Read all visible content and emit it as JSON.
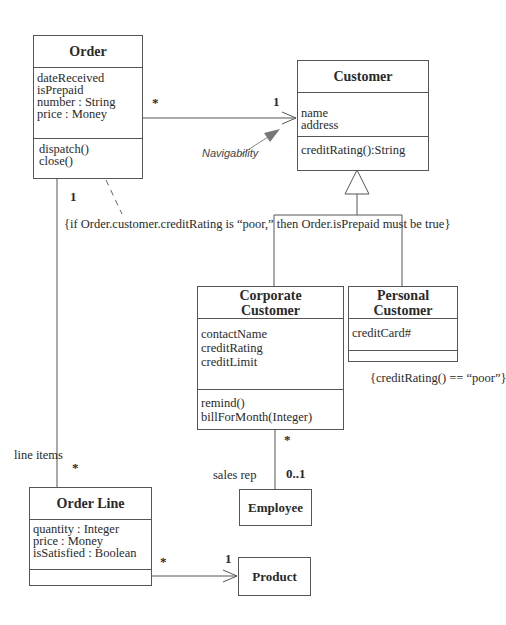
{
  "classes": {
    "order": {
      "name": "Order",
      "attributes": [
        "dateReceived",
        "isPrepaid",
        "number : String",
        "price : Money"
      ],
      "operations": [
        "dispatch()",
        "close()"
      ]
    },
    "customer": {
      "name": "Customer",
      "attributes": [
        "name",
        "address"
      ],
      "operations": [
        "creditRating():String"
      ]
    },
    "corporate_customer": {
      "name_line1": "Corporate",
      "name_line2": "Customer",
      "attributes": [
        "contactName",
        "creditRating",
        "creditLimit"
      ],
      "operations": [
        "remind()",
        "billForMonth(Integer)"
      ]
    },
    "personal_customer": {
      "name_line1": "Personal",
      "name_line2": "Customer",
      "attributes": [
        "creditCard#"
      ],
      "operations": []
    },
    "order_line": {
      "name": "Order Line",
      "attributes": [
        "quantity : Integer",
        "price : Money",
        "isSatisfied : Boolean"
      ],
      "operations": []
    },
    "employee": {
      "name": "Employee"
    },
    "product": {
      "name": "Product"
    }
  },
  "associations": {
    "order_customer": {
      "order_end": "*",
      "customer_end": "1"
    },
    "order_orderline": {
      "order_end": "1",
      "orderline_end": "*",
      "role": [
        "line",
        "items"
      ]
    },
    "corporate_employee": {
      "corporate_end": "*",
      "employee_end": "0..1",
      "role": "sales rep"
    },
    "orderline_product": {
      "orderline_end": "*",
      "product_end": "1"
    }
  },
  "annotations": {
    "navigability": "Navigability",
    "order_constraint": [
      "{if Order.customer.creditRating is",
      "“poor,” then Order.isPrepaid",
      "must be true}"
    ],
    "personal_constraint": [
      "{creditRating()",
      "== “poor”}"
    ]
  },
  "colors": {
    "line": "#555555",
    "nav_arrow": "#777777",
    "text": "#2a2a2a"
  }
}
